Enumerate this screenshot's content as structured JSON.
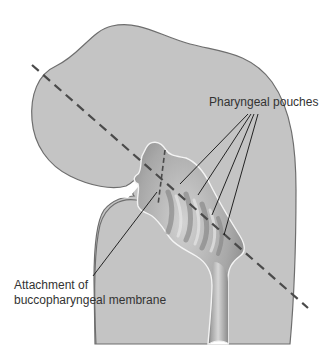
{
  "diagram": {
    "type": "anatomical-illustration",
    "labels": {
      "pharyngeal_pouches": "Pharyngeal pouches",
      "attachment_line1": "Attachment of",
      "attachment_line2": "buccopharyngeal membrane"
    },
    "colors": {
      "body_fill": "#c4c4c4",
      "body_stroke": "#707070",
      "pharynx_dark": "#8a8a8a",
      "pharynx_light": "#d8d8d8",
      "dashed_line": "#4a4a4a",
      "leader_lines": "#111111",
      "text": "#333333",
      "background": "#ffffff"
    },
    "pouch_count": 4
  }
}
